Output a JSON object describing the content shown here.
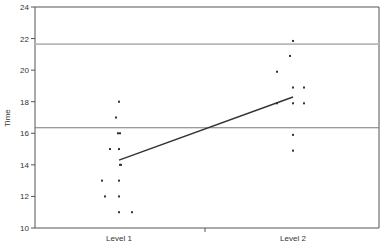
{
  "chart_data": {
    "type": "scatter",
    "title": "",
    "xlabel": "",
    "ylabel": "Time",
    "ylim": [
      10,
      24
    ],
    "yticks": [
      10,
      12,
      14,
      16,
      18,
      20,
      22,
      24
    ],
    "categories": [
      "Level 1",
      "Level 2"
    ],
    "grid": false,
    "legend": null,
    "series": [
      {
        "name": "Level 1",
        "points": [
          {
            "dx": 0,
            "y": 18
          },
          {
            "dx": -3,
            "y": 17
          },
          {
            "dx": -1,
            "y": 16
          },
          {
            "dx": 1,
            "y": 16
          },
          {
            "dx": -9,
            "y": 15
          },
          {
            "dx": 0,
            "y": 15
          },
          {
            "dx": 1,
            "y": 14
          },
          {
            "dx": 2,
            "y": 14
          },
          {
            "dx": -17,
            "y": 13
          },
          {
            "dx": 0,
            "y": 13
          },
          {
            "dx": -14,
            "y": 12
          },
          {
            "dx": 0,
            "y": 12
          },
          {
            "dx": 0,
            "y": 11
          },
          {
            "dx": 13,
            "y": 11
          }
        ]
      },
      {
        "name": "Level 2",
        "points": [
          {
            "dx": 0,
            "y": 21.85
          },
          {
            "dx": -3,
            "y": 20.9
          },
          {
            "dx": -16,
            "y": 19.9
          },
          {
            "dx": 0,
            "y": 18.9
          },
          {
            "dx": 11,
            "y": 18.9
          },
          {
            "dx": -16,
            "y": 17.9
          },
          {
            "dx": 0,
            "y": 17.9
          },
          {
            "dx": 11,
            "y": 17.9
          },
          {
            "dx": 0,
            "y": 15.9
          },
          {
            "dx": 0,
            "y": 14.9
          }
        ]
      }
    ],
    "mean_line": {
      "from": {
        "category": "Level 1",
        "y": 14.3
      },
      "to": {
        "category": "Level 2",
        "y": 18.3
      }
    },
    "reference_lines": [
      {
        "y": 21.65,
        "color": "#b8b8b8",
        "width": 1.6
      },
      {
        "y": 16.35,
        "color": "#7a7a7a",
        "width": 1.2
      }
    ]
  },
  "layout": {
    "plot": {
      "left": 35,
      "top": 7,
      "right": 379,
      "bottom": 228
    },
    "category_x": [
      119,
      293
    ],
    "mid_tick_x": 205
  }
}
